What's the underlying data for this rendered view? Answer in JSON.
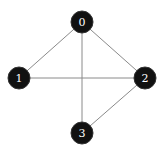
{
  "diagram": {
    "type": "graph",
    "directed": false,
    "colors": {
      "node_fill": "#111111",
      "node_label": "#ffffff",
      "edge": "#8a8a8a",
      "background": "#ffffff"
    },
    "nodes": [
      {
        "id": "0",
        "label": "0",
        "position": "top"
      },
      {
        "id": "1",
        "label": "1",
        "position": "left"
      },
      {
        "id": "2",
        "label": "2",
        "position": "right"
      },
      {
        "id": "3",
        "label": "3",
        "position": "bottom"
      }
    ],
    "edges": [
      {
        "source": "0",
        "target": "1"
      },
      {
        "source": "0",
        "target": "2"
      },
      {
        "source": "0",
        "target": "3"
      },
      {
        "source": "1",
        "target": "2"
      },
      {
        "source": "2",
        "target": "3"
      }
    ]
  }
}
